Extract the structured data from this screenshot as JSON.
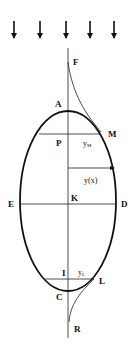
{
  "diagram": {
    "type": "hydrostatic-bubble-profile",
    "colors": {
      "stroke": "#111111",
      "background": "#ffffff"
    },
    "arrows": {
      "count": 5,
      "icon": "down-arrow-icon",
      "x": [
        14,
        40,
        66,
        90,
        114
      ]
    },
    "labels": {
      "F": "F",
      "A": "A",
      "M": "M",
      "P": "P",
      "yM": "y",
      "yM_sub": "M",
      "yx": "y(x)",
      "E": "E",
      "K": "K",
      "D": "D",
      "I": "I",
      "yL": "y",
      "yL_sub": "L",
      "L": "L",
      "C": "C",
      "R": "R"
    }
  }
}
